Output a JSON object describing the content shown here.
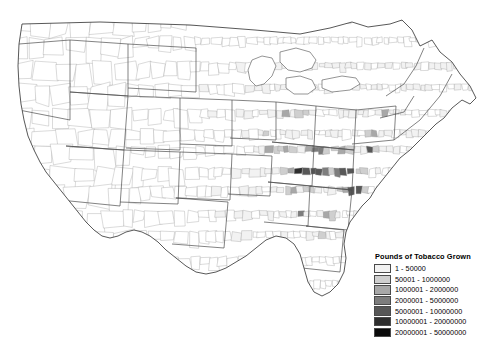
{
  "map": {
    "title": "Pounds of Tobacco Grown",
    "region": "United States (contiguous 48 states), county level",
    "projection_note": "county choropleth, no visible frame, white background",
    "background_color": "#ffffff",
    "county_border_color": "#808080",
    "state_border_color": "#4d4d4d"
  },
  "legend": {
    "title": "Pounds of Tobacco Grown",
    "entries": [
      {
        "label": "1 - 50000",
        "color": "#f2f2f2",
        "min": 1,
        "max": 50000
      },
      {
        "label": "50001 - 1000000",
        "color": "#cfcfcf",
        "min": 50001,
        "max": 1000000
      },
      {
        "label": "1000001 - 2000000",
        "color": "#a8a8a8",
        "min": 1000001,
        "max": 2000000
      },
      {
        "label": "2000001 - 5000000",
        "color": "#7d7d7d",
        "min": 2000001,
        "max": 5000000
      },
      {
        "label": "5000001 - 10000000",
        "color": "#575757",
        "min": 5000001,
        "max": 10000000
      },
      {
        "label": "10000001 - 20000000",
        "color": "#2e2e2e",
        "min": 10000001,
        "max": 20000000
      },
      {
        "label": "20000001 - 50000000",
        "color": "#0a0a0a",
        "min": 20000001,
        "max": 50000000
      }
    ]
  },
  "chart_data": {
    "type": "heatmap",
    "title": "Pounds of Tobacco Grown",
    "subtitle": "",
    "xlabel": "",
    "ylabel": "",
    "legend_position": "bottom-right",
    "grid": false,
    "class_breaks": [
      1,
      50000,
      1000000,
      2000000,
      5000000,
      10000000,
      20000000,
      50000000
    ],
    "class_labels": [
      "1 - 50000",
      "50001 - 1000000",
      "1000001 - 2000000",
      "2000001 - 5000000",
      "5000001 - 10000000",
      "10000001 - 20000000",
      "20000001 - 50000000"
    ],
    "class_colors": [
      "#f2f2f2",
      "#cfcfcf",
      "#a8a8a8",
      "#7d7d7d",
      "#575757",
      "#2e2e2e",
      "#0a0a0a"
    ],
    "high_density_clusters": [
      {
        "name": "Kentucky Bluegrass / Central Kentucky",
        "class": "20000001 - 50000000"
      },
      {
        "name": "North Carolina Coastal Plain / Piedmont",
        "class": "20000001 - 50000000"
      },
      {
        "name": "Southern Virginia",
        "class": "10000001 - 20000000"
      },
      {
        "name": "Tennessee Upper Cumberland",
        "class": "5000001 - 10000000"
      },
      {
        "name": "South Carolina Pee Dee",
        "class": "10000001 - 20000000"
      },
      {
        "name": "Connecticut River Valley",
        "class": "5000001 - 10000000"
      },
      {
        "name": "Southern Wisconsin",
        "class": "5000001 - 10000000"
      },
      {
        "name": "Lancaster County, Pennsylvania",
        "class": "10000001 - 20000000"
      },
      {
        "name": "Southern Georgia",
        "class": "2000001 - 5000000"
      },
      {
        "name": "Southern Maryland",
        "class": "5000001 - 10000000"
      }
    ],
    "low_or_no_production_regions": [
      "Pacific Northwest",
      "Great Basin",
      "Rocky Mountains",
      "Northern Plains",
      "Texas",
      "Southwest",
      "Florida Peninsula"
    ]
  }
}
